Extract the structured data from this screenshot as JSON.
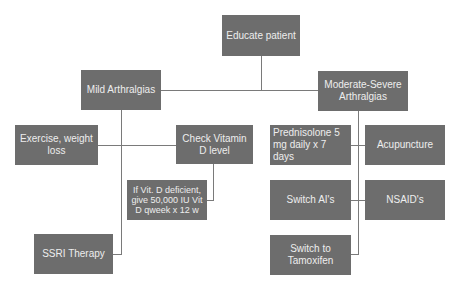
{
  "diagram": {
    "type": "flowchart",
    "colors": {
      "box_fill": "#6d6d6d",
      "box_text": "#eeeeee",
      "connector": "#7a7a7a",
      "background": "#ffffff"
    },
    "nodes": {
      "educate": "Educate patient",
      "mild": "Mild Arthralgias",
      "moderate": "Moderate-Severe Arthralgias",
      "exercise": "Exercise, weight loss",
      "vitd_check": "Check Vitamin D level",
      "vitd_deficient": "If Vit. D deficient, give 50,000 IU Vit D qweek x 12 w",
      "ssri": "SSRI Therapy",
      "prednisolone": "Prednisolone 5 mg daily x 7 days",
      "acupuncture": "Acupuncture",
      "switch_ai": "Switch AI's",
      "nsaids": "NSAID's",
      "tamoxifen": "Switch to Tamoxifen"
    },
    "edges": [
      [
        "educate",
        "mild"
      ],
      [
        "educate",
        "moderate"
      ],
      [
        "mild",
        "exercise"
      ],
      [
        "mild",
        "vitd_check"
      ],
      [
        "vitd_check",
        "vitd_deficient"
      ],
      [
        "mild",
        "ssri"
      ],
      [
        "moderate",
        "prednisolone"
      ],
      [
        "moderate",
        "acupuncture"
      ],
      [
        "moderate",
        "switch_ai"
      ],
      [
        "moderate",
        "nsaids"
      ],
      [
        "moderate",
        "tamoxifen"
      ]
    ]
  }
}
